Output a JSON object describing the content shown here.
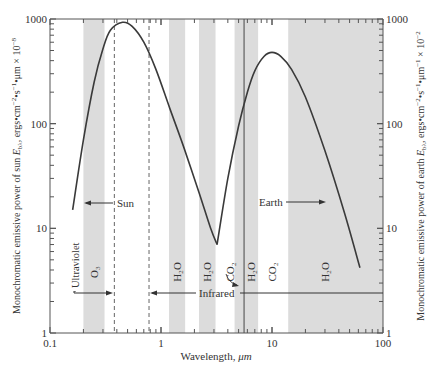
{
  "chart_data": {
    "type": "line",
    "title": "",
    "xlabel": "Wavelength, μm",
    "ylabel_left": "Monochromatic emissive power of sun E_bλ, ergs•cm⁻²•s⁻¹•μm × 10⁻⁸",
    "ylabel_right": "Monochromatic emissive power of earth E_bλ, ergs•cm⁻²•s⁻¹•μm⁻¹ × 10⁻²",
    "xscale": "log",
    "yscale": "log",
    "xlim": [
      0.1,
      100
    ],
    "ylim": [
      1,
      1000
    ],
    "x_ticks": [
      "0.1",
      "1",
      "10",
      "100"
    ],
    "y_ticks_left": [
      "1",
      "10",
      "100",
      "1000"
    ],
    "y_ticks_right": [
      "1",
      "10",
      "100",
      "1000"
    ],
    "grid": false,
    "series": [
      {
        "name": "Sun",
        "x": [
          0.16,
          0.2,
          0.25,
          0.3,
          0.35,
          0.45,
          0.55,
          0.7,
          0.9,
          1.2,
          1.6,
          2.2,
          2.8,
          3.2
        ],
        "y": [
          15,
          70,
          250,
          520,
          780,
          930,
          850,
          600,
          330,
          140,
          60,
          22,
          10,
          7
        ]
      },
      {
        "name": "Earth",
        "x": [
          3.2,
          4,
          5,
          6,
          7,
          8.5,
          10,
          12,
          15,
          20,
          30,
          45,
          62
        ],
        "y": [
          7,
          30,
          95,
          200,
          320,
          440,
          480,
          440,
          330,
          180,
          55,
          14,
          4.2
        ]
      }
    ],
    "absorption_bands": [
      {
        "label": "O3",
        "x_range": [
          0.2,
          0.31
        ]
      },
      {
        "label": "H2O",
        "x_range": [
          1.18,
          1.65
        ]
      },
      {
        "label": "H2O",
        "x_range": [
          2.2,
          3.1
        ]
      },
      {
        "label": "CO2",
        "x_range": [
          4.6,
          5.5
        ]
      },
      {
        "label": "H2O",
        "x_range": [
          5.5,
          7.5
        ]
      },
      {
        "label": "H2O",
        "x_range": [
          14,
          100
        ]
      }
    ],
    "band_labels": [
      {
        "text": "O₃",
        "x": 0.25
      },
      {
        "text": "H₂O",
        "x": 1.4
      },
      {
        "text": "H₂O",
        "x": 2.6
      },
      {
        "text": "CO₂",
        "x": 4.2
      },
      {
        "text": "H₂O",
        "x": 6.5
      },
      {
        "text": "CO₂",
        "x": 10
      },
      {
        "text": "H₂O",
        "x": 30
      }
    ],
    "reference_lines": [
      {
        "type": "dashed",
        "x": 0.38
      },
      {
        "type": "dashed",
        "x": 0.78
      },
      {
        "type": "solid",
        "x": 5.6
      }
    ],
    "annotations": [
      {
        "text": "Sun",
        "arrow": "left"
      },
      {
        "text": "Earth",
        "arrow": "right"
      },
      {
        "text": "Ultraviolet",
        "arrow": "right",
        "orientation": "vertical"
      },
      {
        "text": "Infrared",
        "arrow": "both"
      }
    ]
  },
  "labels": {
    "xlabel": "Wavelength, ",
    "xlabel_unit": "μm",
    "ylabel_left_a": "Monochromatic emissive power of sun ",
    "ylabel_left_b": ", ergs•cm",
    "ylabel_left_c": "•s",
    "ylabel_left_d": "•μm × 10",
    "ylabel_right_a": "Monochromatic emissive power of earth ",
    "ylabel_right_b": ", ergs•cm",
    "ylabel_right_c": "•s",
    "ylabel_right_d": "•μm",
    "ylabel_right_e": " × 10",
    "sun": "Sun",
    "earth": "Earth",
    "ultraviolet": "Ultraviolet",
    "infrared": "Infrared"
  },
  "colors": {
    "band": "#dcdcdc",
    "curve": "#3a3a3a",
    "axis": "#555555",
    "text": "#333333"
  }
}
